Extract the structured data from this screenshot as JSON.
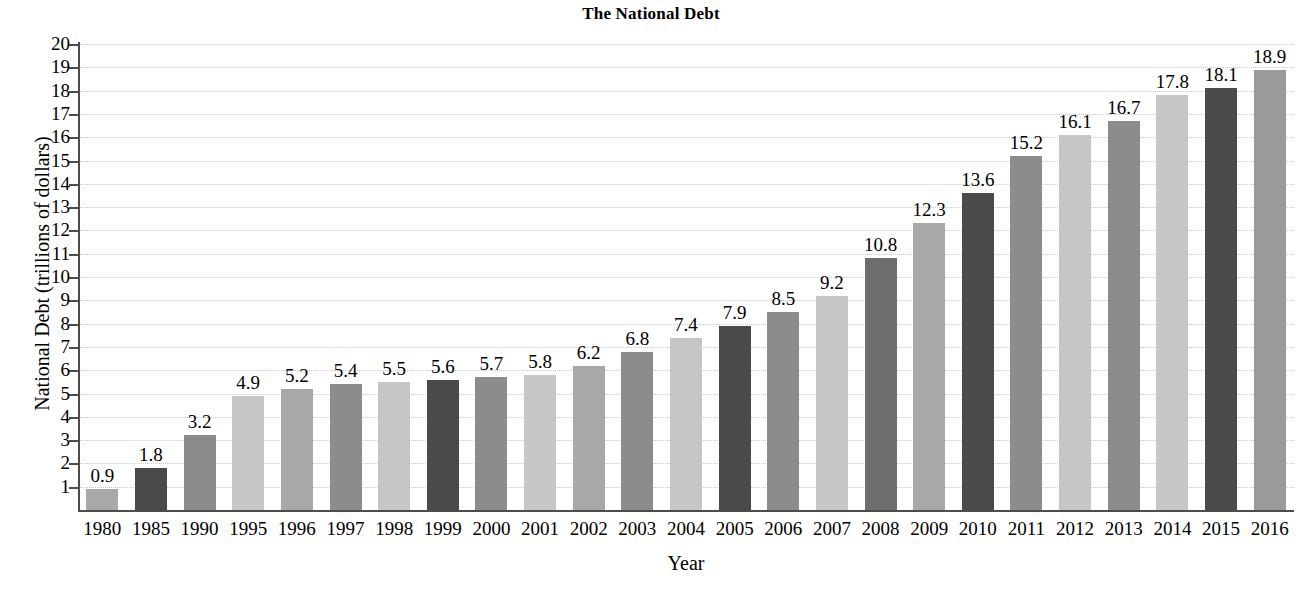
{
  "chart_data": {
    "type": "bar",
    "title": "The National Debt",
    "xlabel": "Year",
    "ylabel": "National Debt (trillions of dollars)",
    "categories": [
      "1980",
      "1985",
      "1990",
      "1995",
      "1996",
      "1997",
      "1998",
      "1999",
      "2000",
      "2001",
      "2002",
      "2003",
      "2004",
      "2005",
      "2006",
      "2007",
      "2008",
      "2009",
      "2010",
      "2011",
      "2012",
      "2013",
      "2014",
      "2015",
      "2016"
    ],
    "values": [
      0.9,
      1.8,
      3.2,
      4.9,
      5.2,
      5.4,
      5.5,
      5.6,
      5.7,
      5.8,
      6.2,
      6.8,
      7.4,
      7.9,
      8.5,
      9.2,
      10.8,
      12.3,
      13.6,
      15.2,
      16.1,
      16.7,
      17.8,
      18.1,
      18.9
    ],
    "value_labels": [
      "0.9",
      "1.8",
      "3.2",
      "4.9",
      "5.2",
      "5.4",
      "5.5",
      "5.6",
      "5.7",
      "5.8",
      "6.2",
      "6.8",
      "7.4",
      "7.9",
      "8.5",
      "9.2",
      "10.8",
      "12.3",
      "13.6",
      "15.2",
      "16.1",
      "16.7",
      "17.8",
      "18.1",
      "18.9"
    ],
    "ylim": [
      0,
      20
    ],
    "ytick_labels": [
      "20",
      "19",
      "18",
      "17",
      "16",
      "15",
      "14",
      "13",
      "12",
      "11",
      "10",
      "9",
      "8",
      "7",
      "6",
      "5",
      "4",
      "3",
      "2",
      "1"
    ],
    "ytick_values": [
      20,
      19,
      18,
      17,
      16,
      15,
      14,
      13,
      12,
      11,
      10,
      9,
      8,
      7,
      6,
      5,
      4,
      3,
      2,
      1
    ],
    "grid": true,
    "legend": false,
    "bar_colors": [
      "#a8a8a8",
      "#4a4a4a",
      "#8c8c8c",
      "#c6c6c6",
      "#a8a8a8",
      "#8c8c8c",
      "#c6c6c6",
      "#4a4a4a",
      "#8c8c8c",
      "#c6c6c6",
      "#a8a8a8",
      "#8c8c8c",
      "#c6c6c6",
      "#4a4a4a",
      "#8c8c8c",
      "#c6c6c6",
      "#6e6e6e",
      "#a8a8a8",
      "#4a4a4a",
      "#8c8c8c",
      "#c6c6c6",
      "#8c8c8c",
      "#c6c6c6",
      "#4a4a4a",
      "#9a9a9a"
    ],
    "axis_color": "#4c4c4c",
    "grid_color": "#c9c9c9"
  }
}
